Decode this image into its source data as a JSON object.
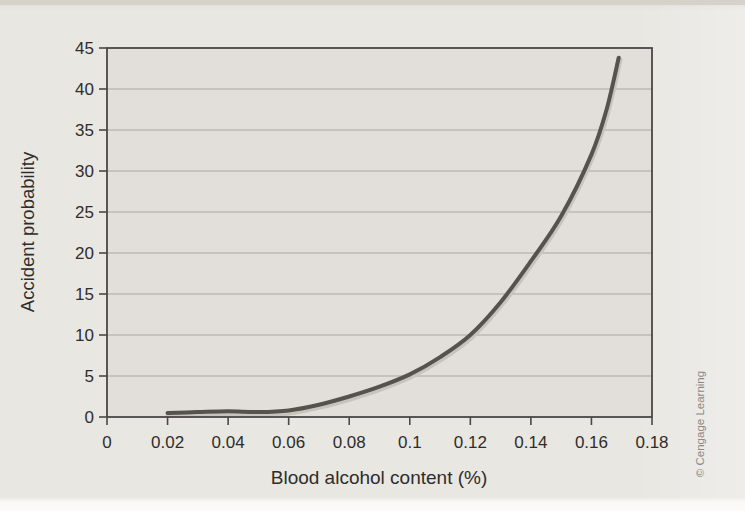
{
  "page": {
    "credit": "© Cengage Learning",
    "background_color": "#e9e7e2"
  },
  "chart_data": {
    "type": "line",
    "title": "",
    "xlabel": "Blood alcohol content (%)",
    "ylabel": "Accident probability",
    "x": [
      0.02,
      0.03,
      0.04,
      0.05,
      0.06,
      0.07,
      0.08,
      0.09,
      0.1,
      0.11,
      0.12,
      0.13,
      0.14,
      0.15,
      0.16,
      0.165,
      0.169
    ],
    "y": [
      0.5,
      0.6,
      0.7,
      0.6,
      0.8,
      1.5,
      2.5,
      3.7,
      5.2,
      7.3,
      10,
      14,
      19,
      24.5,
      32,
      37.5,
      43.8
    ],
    "xlim": [
      0,
      0.18
    ],
    "ylim": [
      0,
      45
    ],
    "x_ticks": [
      0,
      0.02,
      0.04,
      0.06,
      0.08,
      0.1,
      0.12,
      0.14,
      0.16,
      0.18
    ],
    "x_tick_labels": [
      "0",
      "0.02",
      "0.04",
      "0.06",
      "0.08",
      "0.1",
      "0.12",
      "0.14",
      "0.16",
      "0.18"
    ],
    "y_ticks": [
      0,
      5,
      10,
      15,
      20,
      25,
      30,
      35,
      40,
      45
    ],
    "y_tick_labels": [
      "0",
      "5",
      "10",
      "15",
      "20",
      "25",
      "30",
      "35",
      "40",
      "45"
    ],
    "grid": "horizontal",
    "legend": "none",
    "line_color": "#55534e",
    "line_halo_color": "#c7c4be",
    "line_width": 4,
    "grid_color": "#a9a7a3",
    "axis_color": "#4a4846",
    "plot_bg": "#e2dfda",
    "label_color": "#2f2d2b",
    "credit_color": "#8b8984"
  }
}
